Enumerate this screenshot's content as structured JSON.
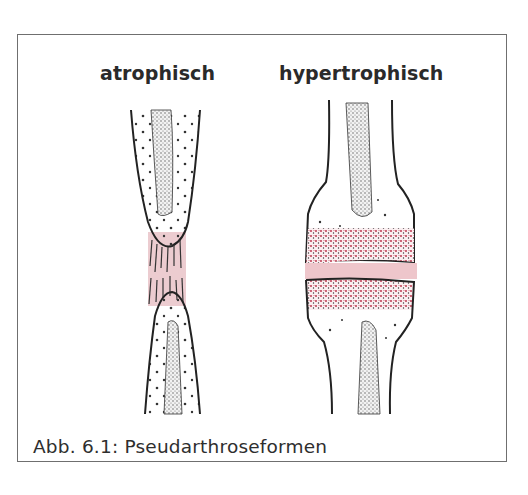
{
  "figure": {
    "labels": {
      "atrophic": "atrophisch",
      "hypertrophic": "hypertrophisch"
    },
    "caption": "Abb. 6.1: Pseudarthroseformen",
    "illustrations": [
      {
        "name": "atrophic-pseudarthrosis",
        "description": "tapered bone ends joined by thin pink fibrous tissue"
      },
      {
        "name": "hypertrophic-pseudarthrosis",
        "description": "widened bone ends with red-stippled callus separated by pink gap"
      }
    ],
    "colors": {
      "frame": "#6f6f6f",
      "outline": "#222222",
      "fibrous_tissue": "#e9c3c8",
      "callus_stipple": "#b5263e",
      "marrow_stipple": "#555555"
    }
  }
}
